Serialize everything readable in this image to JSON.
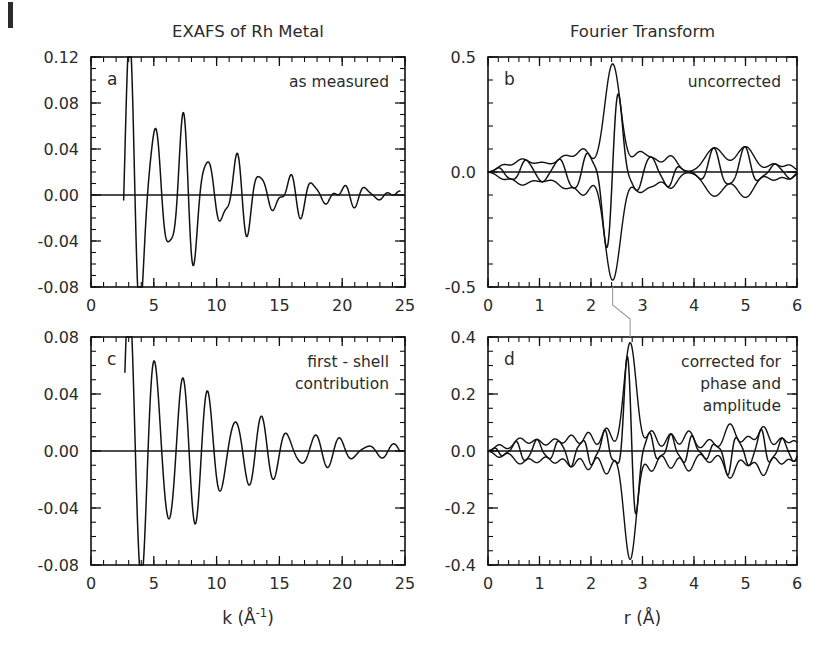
{
  "figure": {
    "titles": {
      "left": "EXAFS of Rh Metal",
      "right": "Fourier Transform"
    },
    "axis_labels": {
      "k": "k (Å-1)",
      "k_base": "k (Å",
      "k_sup": "-1",
      "k_close": ")",
      "r": "r (Å)"
    }
  },
  "chart_data": [
    {
      "id": "a",
      "type": "line",
      "panel_letter": "a",
      "title": "EXAFS of Rh Metal",
      "annotation": [
        "as measured"
      ],
      "xlabel": "k (Å-1)",
      "ylabel": "",
      "xlim": [
        0,
        25
      ],
      "ylim": [
        -0.08,
        0.12
      ],
      "xticks": [
        0,
        5,
        10,
        15,
        20,
        25
      ],
      "xtick_labels": [
        "0",
        "5",
        "10",
        "15",
        "20",
        "25"
      ],
      "yticks": [
        -0.08,
        -0.04,
        0.0,
        0.04,
        0.08,
        0.12
      ],
      "ytick_labels": [
        "-0.08",
        "-0.04",
        "0.00",
        "0.04",
        "0.08",
        "0.12"
      ],
      "x_minor_step": 1,
      "y_minor_step": 0.01,
      "grid": false,
      "zero_line": 0.0,
      "series": [
        {
          "name": "chi(k) as measured",
          "model": "exafs_measured",
          "k_start": 2.6,
          "k_end": 24.6,
          "components": [
            {
              "amp": 0.102,
              "freq": 5.42,
              "phase": -1.15,
              "decay": 0.155,
              "sigma2": 0.0
            },
            {
              "amp": 0.03,
              "freq": 7.95,
              "phase": 0.55,
              "decay": 0.115,
              "sigma2": 0.0
            },
            {
              "amp": 0.018,
              "freq": 10.6,
              "phase": 2.1,
              "decay": 0.105,
              "sigma2": 0.0
            }
          ],
          "peaks_k": [
            3.2,
            4.7,
            5.9,
            7.0,
            8.2,
            9.4,
            10.6,
            11.7,
            12.8,
            13.9,
            15.0
          ],
          "peaks_y": [
            0.103,
            0.064,
            0.035,
            0.03,
            0.039,
            0.039,
            0.036,
            0.02,
            0.014,
            0.01,
            0.006
          ]
        }
      ]
    },
    {
      "id": "b",
      "type": "line",
      "panel_letter": "b",
      "title": "Fourier Transform",
      "annotation": [
        "uncorrected"
      ],
      "xlabel": "r (Å)",
      "ylabel": "",
      "xlim": [
        0,
        6
      ],
      "ylim": [
        -0.5,
        0.5
      ],
      "xticks": [
        0,
        1,
        2,
        3,
        4,
        5,
        6
      ],
      "xtick_labels": [
        "0",
        "1",
        "2",
        "3",
        "4",
        "5",
        "6"
      ],
      "yticks": [
        -0.5,
        0.0,
        0.5
      ],
      "ytick_labels": [
        "-0.5",
        "0.0",
        "0.5"
      ],
      "x_minor_step": 0.2,
      "y_minor_step": 0.1,
      "grid": false,
      "zero_line": 0.0,
      "main_peak_r": 2.42,
      "main_peak_value": 0.47,
      "series": [
        {
          "name": "magnitude envelope",
          "model": "ft_envelope",
          "peaks": [
            {
              "r": 0.3,
              "amp": 0.03,
              "width": 0.16
            },
            {
              "r": 0.66,
              "amp": 0.055,
              "width": 0.2
            },
            {
              "r": 1.05,
              "amp": 0.04,
              "width": 0.22
            },
            {
              "r": 1.5,
              "amp": 0.07,
              "width": 0.22
            },
            {
              "r": 1.86,
              "amp": 0.095,
              "width": 0.18
            },
            {
              "r": 2.42,
              "amp": 0.47,
              "width": 0.22
            },
            {
              "r": 2.95,
              "amp": 0.085,
              "width": 0.18
            },
            {
              "r": 3.22,
              "amp": 0.05,
              "width": 0.16
            },
            {
              "r": 3.55,
              "amp": 0.07,
              "width": 0.17
            },
            {
              "r": 4.4,
              "amp": 0.105,
              "width": 0.26
            },
            {
              "r": 5.0,
              "amp": 0.11,
              "width": 0.24
            },
            {
              "r": 5.55,
              "amp": 0.035,
              "width": 0.16
            },
            {
              "r": 5.85,
              "amp": 0.03,
              "width": 0.14
            }
          ]
        },
        {
          "name": "real part oscillation",
          "model": "ft_real",
          "frequency": 10.4,
          "phase": 0.0
        }
      ]
    },
    {
      "id": "c",
      "type": "line",
      "panel_letter": "c",
      "title": "",
      "annotation": [
        "first - shell",
        "contribution"
      ],
      "xlabel": "k (Å-1)",
      "ylabel": "",
      "xlim": [
        0,
        25
      ],
      "ylim": [
        -0.08,
        0.08
      ],
      "xticks": [
        0,
        5,
        10,
        15,
        20,
        25
      ],
      "xtick_labels": [
        "0",
        "5",
        "10",
        "15",
        "20",
        "25"
      ],
      "yticks": [
        -0.08,
        -0.04,
        0.0,
        0.04,
        0.08
      ],
      "ytick_labels": [
        "-0.08",
        "-0.04",
        "0.00",
        "0.04",
        "0.08"
      ],
      "x_minor_step": 1,
      "y_minor_step": 0.01,
      "grid": false,
      "zero_line": 0.0,
      "series": [
        {
          "name": "chi(k) first shell",
          "model": "exafs_first_shell",
          "k_start": 2.7,
          "k_end": 24.6,
          "components": [
            {
              "amp": 0.098,
              "freq": 5.42,
              "phase": -1.15,
              "decay": 0.15,
              "sigma2": 0.0
            },
            {
              "amp": 0.016,
              "freq": 7.6,
              "phase": 1.2,
              "decay": 0.1,
              "sigma2": 0.0
            }
          ],
          "peaks_k": [
            3.2,
            4.5,
            5.6,
            6.8,
            8.2,
            9.3,
            10.8,
            11.9,
            13.0,
            14.2,
            15.3
          ],
          "peaks_y": [
            0.09,
            0.04,
            0.03,
            0.031,
            0.039,
            0.032,
            0.026,
            0.018,
            0.012,
            0.008,
            0.005
          ]
        }
      ]
    },
    {
      "id": "d",
      "type": "line",
      "panel_letter": "d",
      "title": "",
      "annotation": [
        "corrected for",
        "phase and",
        "amplitude"
      ],
      "xlabel": "r (Å)",
      "ylabel": "",
      "xlim": [
        0,
        6
      ],
      "ylim": [
        -0.4,
        0.4
      ],
      "xticks": [
        0,
        1,
        2,
        3,
        4,
        5,
        6
      ],
      "xtick_labels": [
        "0",
        "1",
        "2",
        "3",
        "4",
        "5",
        "6"
      ],
      "yticks": [
        -0.4,
        -0.2,
        0.0,
        0.2,
        0.4
      ],
      "ytick_labels": [
        "-0.4",
        "-0.2",
        "0.0",
        "0.2",
        "0.4"
      ],
      "x_minor_step": 0.2,
      "y_minor_step": 0.05,
      "grid": false,
      "zero_line": 0.0,
      "main_peak_r": 2.76,
      "main_peak_value": 0.38,
      "series": [
        {
          "name": "magnitude envelope",
          "model": "ft_envelope",
          "peaks": [
            {
              "r": 0.22,
              "amp": 0.022,
              "width": 0.12
            },
            {
              "r": 0.62,
              "amp": 0.045,
              "width": 0.16
            },
            {
              "r": 0.95,
              "amp": 0.04,
              "width": 0.15
            },
            {
              "r": 1.3,
              "amp": 0.042,
              "width": 0.15
            },
            {
              "r": 1.62,
              "amp": 0.055,
              "width": 0.14
            },
            {
              "r": 1.95,
              "amp": 0.065,
              "width": 0.13
            },
            {
              "r": 2.3,
              "amp": 0.08,
              "width": 0.13
            },
            {
              "r": 2.76,
              "amp": 0.38,
              "width": 0.17
            },
            {
              "r": 3.18,
              "amp": 0.07,
              "width": 0.13
            },
            {
              "r": 3.55,
              "amp": 0.06,
              "width": 0.13
            },
            {
              "r": 3.9,
              "amp": 0.07,
              "width": 0.14
            },
            {
              "r": 4.3,
              "amp": 0.04,
              "width": 0.13
            },
            {
              "r": 4.7,
              "amp": 0.095,
              "width": 0.15
            },
            {
              "r": 5.05,
              "amp": 0.05,
              "width": 0.14
            },
            {
              "r": 5.35,
              "amp": 0.085,
              "width": 0.14
            },
            {
              "r": 5.7,
              "amp": 0.045,
              "width": 0.13
            },
            {
              "r": 5.95,
              "amp": 0.035,
              "width": 0.12
            }
          ]
        },
        {
          "name": "real part oscillation",
          "model": "ft_real",
          "frequency": 14.5,
          "phase": 0.3
        }
      ]
    }
  ],
  "guide_line": {
    "name": "peak-correspondence-guide",
    "from_panel": "b",
    "from_r": 2.42,
    "to_panel": "d",
    "to_r": 2.76
  }
}
